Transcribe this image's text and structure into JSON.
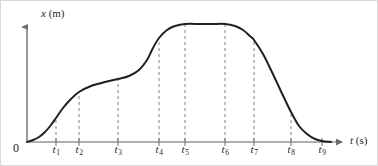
{
  "figure": {
    "name": "position-time-graph",
    "background_color": "#ffffff",
    "border_color": "#d9d9d9",
    "curve_color": "#231f20",
    "axis_color": "#6d6e71",
    "guide_color": "#808285"
  },
  "axes": {
    "y_label_var": "x",
    "y_label_unit": " (m)",
    "x_label_var": "t",
    "x_label_unit": " (s)",
    "origin_label": "0"
  },
  "ticks": [
    {
      "label": "t",
      "sub": "1",
      "x": 55
    },
    {
      "label": "t",
      "sub": "2",
      "x": 78
    },
    {
      "label": "t",
      "sub": "3",
      "x": 117
    },
    {
      "label": "t",
      "sub": "4",
      "x": 158
    },
    {
      "label": "t",
      "sub": "5",
      "x": 184
    },
    {
      "label": "t",
      "sub": "6",
      "x": 224
    },
    {
      "label": "t",
      "sub": "7",
      "x": 253
    },
    {
      "label": "t",
      "sub": "8",
      "x": 290
    },
    {
      "label": "t",
      "sub": "9",
      "x": 321
    }
  ],
  "chart_data": {
    "type": "line",
    "title": "",
    "xlabel": "t (s)",
    "ylabel": "x (m)",
    "grid": false,
    "legend": null,
    "xlim": [
      0,
      340
    ],
    "ylim": [
      0,
      120
    ],
    "x_tick_labels": [
      "0",
      "t1",
      "t2",
      "t3",
      "t4",
      "t5",
      "t6",
      "t7",
      "t8",
      "t9"
    ],
    "x_tick_pixels": [
      26,
      55,
      78,
      117,
      158,
      184,
      224,
      253,
      290,
      321
    ],
    "annotations": [
      "dashed vertical guide line at each labeled time from t1 through t8",
      "curve rises from origin, levels into a shoulder between t2 and t3, rises steeply to a maximum plateau between t4 and t6, then falls back to zero near t9"
    ],
    "series": [
      {
        "name": "position",
        "description": "position versus time curve",
        "x": [
          26,
          32,
          38,
          44,
          50,
          55,
          62,
          70,
          78,
          90,
          104,
          117,
          128,
          138,
          146,
          152,
          158,
          166,
          174,
          184,
          200,
          212,
          224,
          234,
          242,
          250,
          253,
          262,
          270,
          278,
          286,
          290,
          298,
          306,
          314,
          321,
          330
        ],
        "y": [
          0,
          2,
          5,
          10,
          17,
          24,
          34,
          43,
          50,
          56,
          60,
          63,
          66,
          72,
          82,
          94,
          104,
          112,
          116,
          118,
          118,
          118,
          118,
          116,
          112,
          105,
          102,
          88,
          72,
          55,
          38,
          30,
          16,
          8,
          3,
          1,
          0
        ],
        "y_units": "arbitrary position units, 0 at the time axis"
      }
    ]
  }
}
